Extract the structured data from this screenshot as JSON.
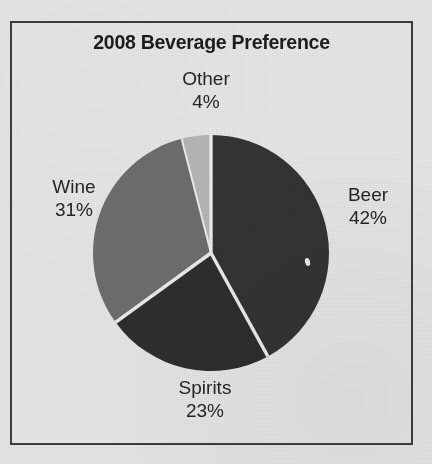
{
  "document": {
    "background_color": "#e7e7e7",
    "frame_color": "#3d3d3d"
  },
  "chart_data": {
    "type": "pie",
    "title": "2008 Beverage Preference",
    "xlabel": "",
    "ylabel": "",
    "legend": "none",
    "labels_position": "outside",
    "start_angle_deg": 0,
    "direction": "clockwise",
    "categories": [
      "Beer",
      "Spirits",
      "Wine",
      "Other"
    ],
    "values": [
      42,
      23,
      31,
      4
    ],
    "value_suffix": "%",
    "slices": [
      {
        "name": "Beer",
        "value": 42,
        "value_text": "42%",
        "color": "#343434",
        "label_text": "Beer",
        "start_deg": 0,
        "end_deg": 151.2
      },
      {
        "name": "Spirits",
        "value": 23,
        "value_text": "23%",
        "color": "#2e2e2e",
        "label_text": "Spirits",
        "start_deg": 151.2,
        "end_deg": 234.0
      },
      {
        "name": "Wine",
        "value": 31,
        "value_text": "31%",
        "color": "#6e6e6e",
        "label_text": "Wine",
        "start_deg": 234.0,
        "end_deg": 345.6
      },
      {
        "name": "Other",
        "value": 4,
        "value_text": "4%",
        "color": "#b6b6b6",
        "label_text": "Other",
        "start_deg": 345.6,
        "end_deg": 360.0
      }
    ],
    "separator_color": "#ededed",
    "geometry": {
      "center_x": 211,
      "center_y": 253,
      "radius": 118
    }
  },
  "artifacts": {
    "scan_speck_name": "scan-speck"
  }
}
